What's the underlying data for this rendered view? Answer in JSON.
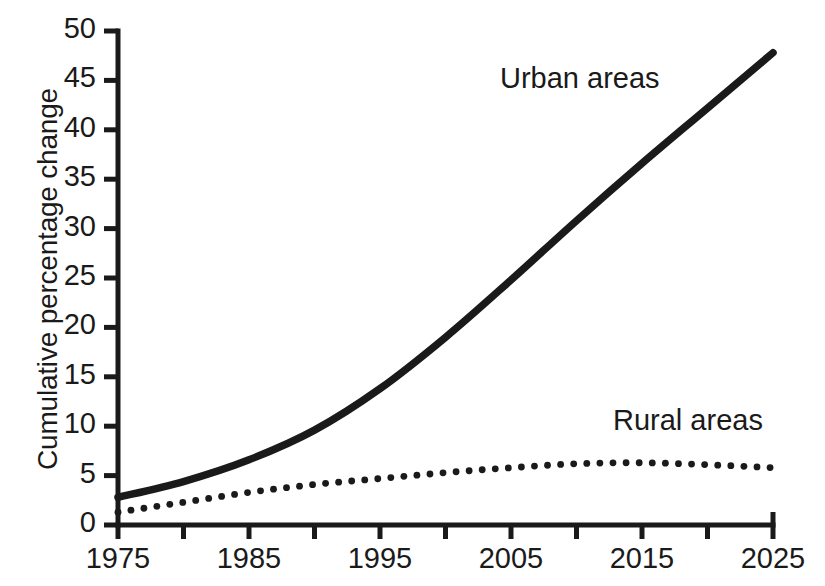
{
  "chart_data": {
    "type": "line",
    "title": "",
    "subtitle": "",
    "xlabel": "",
    "ylabel": "Cumulative percentage change",
    "xlim": [
      1975,
      2025
    ],
    "ylim": [
      0,
      50
    ],
    "grid": false,
    "legend_position": "inline-annotation",
    "x_ticks": [
      1975,
      1985,
      1995,
      2005,
      2015,
      2025
    ],
    "x_tick_labels": [
      "1975",
      "1985",
      "1995",
      "2005",
      "2015",
      "2025"
    ],
    "x_minor_ticks": [
      1980,
      1990,
      2000,
      2010,
      2020
    ],
    "y_ticks": [
      0,
      5,
      10,
      15,
      20,
      25,
      30,
      35,
      40,
      45,
      50
    ],
    "y_tick_labels": [
      "0",
      "5",
      "10",
      "15",
      "20",
      "25",
      "30",
      "35",
      "40",
      "45",
      "50"
    ],
    "series": [
      {
        "name": "Urban areas",
        "style": "solid",
        "color": "#1a1a1a",
        "annotation": "Urban areas",
        "x": [
          1975,
          1980,
          1985,
          1990,
          1995,
          2000,
          2005,
          2010,
          2015,
          2020,
          2025
        ],
        "values": [
          2.8,
          4.4,
          6.6,
          9.6,
          13.8,
          19.0,
          24.8,
          30.8,
          36.6,
          42.2,
          47.8
        ]
      },
      {
        "name": "Rural areas",
        "style": "dotted",
        "color": "#1a1a1a",
        "annotation": "Rural areas",
        "x": [
          1975,
          1980,
          1985,
          1990,
          1995,
          2000,
          2005,
          2010,
          2015,
          2020,
          2025
        ],
        "values": [
          1.3,
          2.3,
          3.3,
          4.1,
          4.7,
          5.3,
          5.8,
          6.2,
          6.3,
          6.1,
          5.8
        ]
      }
    ]
  },
  "annotations": {
    "urban_label": "Urban areas",
    "rural_label": "Rural areas"
  },
  "axes": {
    "y_title": "Cumulative percentage change"
  },
  "colors": {
    "ink": "#1a1a1a",
    "background": "#ffffff"
  }
}
